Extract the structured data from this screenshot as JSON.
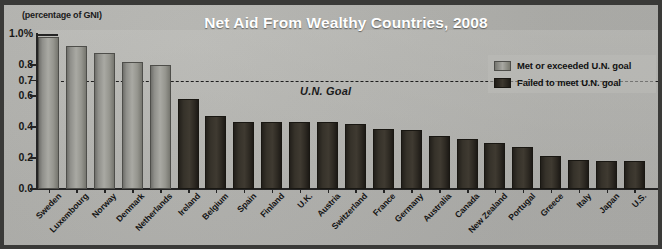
{
  "chart_data": {
    "type": "bar",
    "title": "Net Aid From Wealthy Countries, 2008",
    "units_note": "(percentage of GNI)",
    "xlabel": "",
    "ylabel": "",
    "ylim": [
      0.0,
      1.0
    ],
    "grid": false,
    "legend_position": "top-right",
    "categories": [
      "Sweden",
      "Luxembourg",
      "Norway",
      "Denmark",
      "Netherlands",
      "Ireland",
      "Belgium",
      "Spain",
      "Finland",
      "U.K.",
      "Austria",
      "Switzerland",
      "France",
      "Germany",
      "Australia",
      "Canada",
      "New Zealand",
      "Portugal",
      "Greece",
      "Italy",
      "Japan",
      "U.S."
    ],
    "values": [
      0.98,
      0.92,
      0.88,
      0.82,
      0.8,
      0.58,
      0.47,
      0.43,
      0.43,
      0.43,
      0.43,
      0.42,
      0.39,
      0.38,
      0.34,
      0.32,
      0.3,
      0.27,
      0.21,
      0.19,
      0.18,
      0.18
    ],
    "series": [
      {
        "name": "Net aid as percentage of GNI",
        "values": [
          0.98,
          0.92,
          0.88,
          0.82,
          0.8,
          0.58,
          0.47,
          0.43,
          0.43,
          0.43,
          0.43,
          0.42,
          0.39,
          0.38,
          0.34,
          0.32,
          0.3,
          0.27,
          0.21,
          0.19,
          0.18,
          0.18
        ],
        "groups": [
          "met",
          "met",
          "met",
          "met",
          "met",
          "failed",
          "failed",
          "failed",
          "failed",
          "failed",
          "failed",
          "failed",
          "failed",
          "failed",
          "failed",
          "failed",
          "failed",
          "failed",
          "failed",
          "failed",
          "failed",
          "failed"
        ]
      }
    ],
    "ytick_labels": [
      "1.0%",
      "0.8",
      "0.7",
      "0.6",
      "0.4",
      "0.2",
      "0.0"
    ],
    "ytick_values": [
      1.0,
      0.8,
      0.7,
      0.6,
      0.4,
      0.2,
      0.0
    ],
    "annotations": [
      {
        "name": "un-goal-line",
        "label": "U.N. Goal",
        "value": 0.7,
        "style": "dashed-horizontal"
      }
    ],
    "legend": [
      {
        "label": "Met or exceeded U.N. goal",
        "group": "met",
        "color": "#a8a8a2"
      },
      {
        "label": "Failed to meet U.N. goal",
        "group": "failed",
        "color": "#2e2a23"
      }
    ]
  },
  "colors": {
    "background": "#b4b4b0",
    "frame": "#3a3a38",
    "axis": "#242424",
    "title_text": "#ffffff",
    "body_text": "#141414",
    "bar_met": "#a8a8a2",
    "bar_failed": "#2e2a23"
  }
}
